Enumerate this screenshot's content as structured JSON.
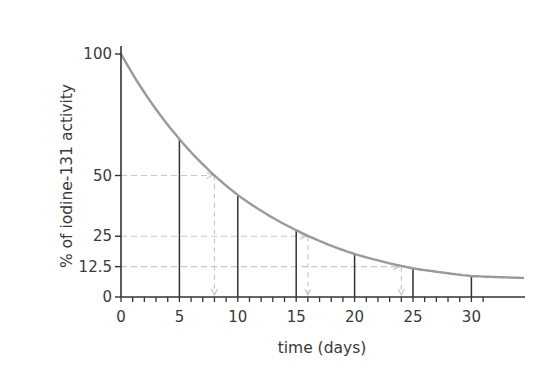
{
  "chart_data": {
    "type": "line",
    "title": "",
    "xlabel": "time (days)",
    "ylabel": "% of iodine-131 activity",
    "xlim": [
      0,
      34.5
    ],
    "ylim": [
      0,
      100
    ],
    "x_ticks": [
      0,
      5,
      10,
      15,
      20,
      25,
      30
    ],
    "x_tick_labels": [
      "0",
      "5",
      "10",
      "15",
      "20",
      "25",
      "30"
    ],
    "y_ticks": [
      0,
      12.5,
      25,
      50,
      100
    ],
    "y_tick_labels": [
      "0",
      "12.5",
      "25",
      "50",
      "100"
    ],
    "minor_x_tick_interval": 1,
    "grid": false,
    "legend": null,
    "series": [
      {
        "name": "iodine-131 decay",
        "x": [
          0,
          5,
          10,
          15,
          20,
          25,
          30,
          34.5
        ],
        "y": [
          100,
          65,
          42,
          27.5,
          17.7,
          11.8,
          8.6,
          7.8
        ],
        "color": "#9a9a9a"
      }
    ],
    "vertical_markers": {
      "x": [
        5,
        10,
        15,
        20,
        25,
        30
      ],
      "y": [
        65,
        42,
        27.5,
        17.7,
        11.8,
        8.6
      ],
      "color": "#333333"
    },
    "half_life_guides": [
      {
        "y": 50,
        "x": 8,
        "label": "first half-life"
      },
      {
        "y": 25,
        "x": 16,
        "label": "second half-life"
      },
      {
        "y": 12.5,
        "x": 24,
        "label": "third half-life"
      }
    ],
    "guide_color": "#c8c8c8"
  }
}
